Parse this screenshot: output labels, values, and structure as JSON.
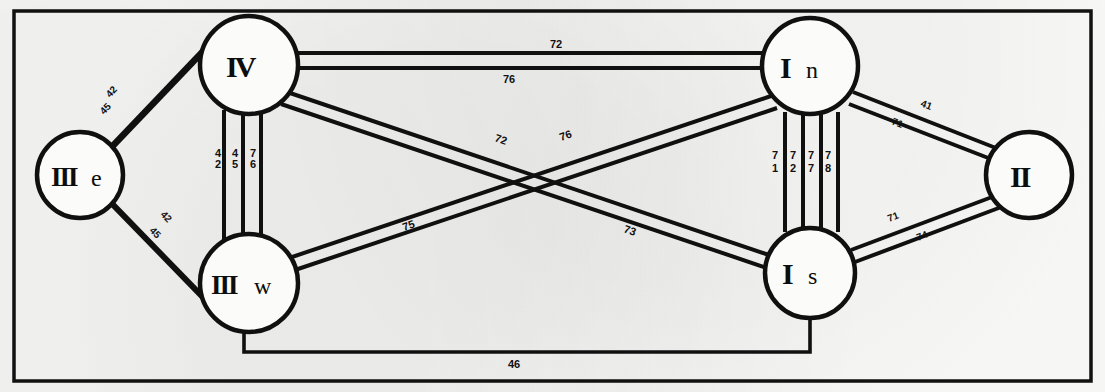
{
  "figure": {
    "frame_color": "#111111",
    "background_color": "#fbfbf9",
    "line_color": "#101010"
  },
  "nodes": [
    {
      "id": "IIIe",
      "roman": "III",
      "suffix": "e",
      "label": "IIIe",
      "cx": 80,
      "cy": 175,
      "r": 43
    },
    {
      "id": "IV",
      "roman": "IV",
      "suffix": "",
      "label": "IV",
      "cx": 249,
      "cy": 65,
      "r": 49
    },
    {
      "id": "IIIw",
      "roman": "III",
      "suffix": "w",
      "label": "IIIw",
      "cx": 249,
      "cy": 283,
      "r": 49
    },
    {
      "id": "In",
      "roman": "I",
      "suffix": "n",
      "label": "In",
      "cx": 810,
      "cy": 66,
      "r": 48
    },
    {
      "id": "Is",
      "roman": "I",
      "suffix": "s",
      "label": "Is",
      "cx": 810,
      "cy": 273,
      "r": 45
    },
    {
      "id": "II",
      "roman": "II",
      "suffix": "",
      "label": "II",
      "cx": 1029,
      "cy": 175,
      "r": 43
    }
  ],
  "links": [
    {
      "id": "IIIe-IV",
      "from": "IIIe",
      "to": "IV",
      "lines": 2,
      "labels": [
        "42",
        "45"
      ]
    },
    {
      "id": "IIIe-IIIw",
      "from": "IIIe",
      "to": "IIIw",
      "lines": 2,
      "labels": [
        "42",
        "45"
      ]
    },
    {
      "id": "IV-IIIw",
      "from": "IV",
      "to": "IIIw",
      "lines": 3,
      "labels": [
        "42",
        "45",
        "76"
      ]
    },
    {
      "id": "IV-In",
      "from": "IV",
      "to": "In",
      "lines": 2,
      "labels": [
        "72",
        "76"
      ]
    },
    {
      "id": "IV-Is",
      "from": "IV",
      "to": "Is",
      "lines": 2,
      "labels": [
        "72",
        "73"
      ]
    },
    {
      "id": "IIIw-In",
      "from": "IIIw",
      "to": "In",
      "lines": 2,
      "labels": [
        "75",
        "76"
      ]
    },
    {
      "id": "In-Is",
      "from": "In",
      "to": "Is",
      "lines": 4,
      "labels": [
        "71",
        "72",
        "77",
        "78"
      ]
    },
    {
      "id": "In-II",
      "from": "In",
      "to": "II",
      "lines": 2,
      "labels": [
        "41",
        "71"
      ]
    },
    {
      "id": "Is-II",
      "from": "Is",
      "to": "II",
      "lines": 2,
      "labels": [
        "71",
        "74"
      ]
    },
    {
      "id": "IIIw-Is",
      "from": "IIIw",
      "to": "Is",
      "lines": 1,
      "labels": [
        "46"
      ]
    }
  ],
  "edge_labels": {
    "iiie_iv_upper": "42",
    "iiie_iv_lower": "45",
    "iiie_iiiw_upper": "42",
    "iiie_iiiw_lower": "45",
    "iv_iiiw_a": "4",
    "iv_iiiw_a2": "2",
    "iv_iiiw_b": "4",
    "iv_iiiw_b2": "5",
    "iv_iiiw_c": "7",
    "iv_iiiw_c2": "6",
    "iv_in_upper": "72",
    "iv_in_lower": "76",
    "iv_is_diag": "72",
    "iv_is_diag2": "73",
    "iiiw_in_diag": "75",
    "iiiw_in_diag2": "76",
    "in_is_a": "7",
    "in_is_a2": "1",
    "in_is_b": "7",
    "in_is_b2": "2",
    "in_is_c": "7",
    "in_is_c2": "7",
    "in_is_d": "7",
    "in_is_d2": "8",
    "in_ii_upper": "41",
    "in_ii_lower": "71",
    "is_ii_upper": "71",
    "is_ii_lower": "74",
    "bottom_link": "46"
  }
}
